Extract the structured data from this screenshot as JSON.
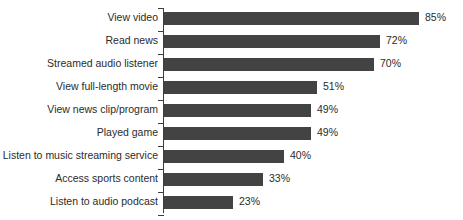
{
  "chart_data": {
    "type": "bar",
    "orientation": "horizontal",
    "title": "",
    "xlabel": "",
    "ylabel": "",
    "xlim": [
      0,
      100
    ],
    "grid": false,
    "legend": false,
    "value_suffix": "%",
    "bar_color": "#434343",
    "axis_color": "#3d3d3d",
    "text_color": "#2b2b2b",
    "categories": [
      "View video",
      "Read news",
      "Streamed audio listener",
      "View full-length movie",
      "View news clip/program",
      "Played game",
      "Listen to music streaming service",
      "Access sports content",
      "Listen to audio podcast"
    ],
    "values": [
      85,
      72,
      70,
      51,
      49,
      49,
      40,
      33,
      23
    ],
    "value_labels": [
      "85%",
      "72%",
      "70%",
      "51%",
      "49%",
      "49%",
      "40%",
      "33%",
      "23%"
    ]
  }
}
